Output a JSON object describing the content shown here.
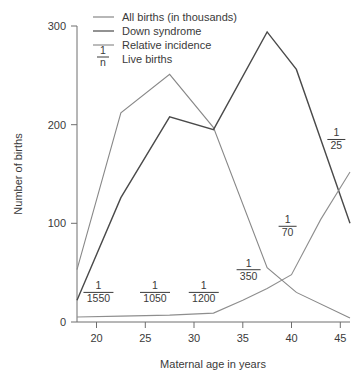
{
  "chart_data": {
    "type": "line",
    "title": "",
    "xlabel": "Maternal age in years",
    "ylabel": "Number of births",
    "xlim": [
      18,
      46
    ],
    "ylim": [
      0,
      300
    ],
    "xticks": [
      20,
      25,
      30,
      35,
      40,
      45
    ],
    "yticks": [
      0,
      100,
      200,
      300
    ],
    "grid": false,
    "legend_position": "top-center",
    "series": [
      {
        "name": "All births (in thousands)",
        "color": "#888888",
        "x": [
          18,
          22.5,
          27.5,
          32,
          37.5,
          40.5,
          46
        ],
        "values": [
          53,
          212,
          251,
          197,
          55,
          30,
          4
        ]
      },
      {
        "name": "Down syndrome",
        "color": "#4a4a4a",
        "x": [
          18,
          22.5,
          27.5,
          32,
          37.5,
          40.5,
          46
        ],
        "values": [
          22,
          126,
          208,
          195,
          294,
          256,
          100
        ]
      },
      {
        "name": "Relative incidence",
        "color": "#8e8e8e",
        "x": [
          18,
          22.5,
          27.5,
          32,
          35,
          37.5,
          40,
          43,
          46
        ],
        "values": [
          5,
          6,
          7,
          9,
          22,
          34,
          48,
          104,
          152
        ]
      }
    ],
    "annotations": [
      {
        "label": "Live births",
        "numerator": "1",
        "denominator": "n"
      },
      {
        "numerator": "1",
        "denominator": "1550",
        "x": 20.2,
        "y": 30
      },
      {
        "numerator": "1",
        "denominator": "1050",
        "x": 26.0,
        "y": 30
      },
      {
        "numerator": "1",
        "denominator": "1200",
        "x": 31.0,
        "y": 30
      },
      {
        "numerator": "1",
        "denominator": "350",
        "x": 35.6,
        "y": 53
      },
      {
        "numerator": "1",
        "denominator": "70",
        "x": 39.6,
        "y": 97
      },
      {
        "numerator": "1",
        "denominator": "25",
        "x": 44.6,
        "y": 185
      }
    ]
  },
  "legend": {
    "items": [
      {
        "label": "All births (in thousands)",
        "marker": "line",
        "color": "#888888"
      },
      {
        "label": "Down syndrome",
        "marker": "line",
        "color": "#4a4a4a"
      },
      {
        "label": "Relative incidence",
        "marker": "line",
        "color": "#8e8e8e"
      },
      {
        "label": "Live births",
        "marker": "fraction",
        "numerator": "1",
        "denominator": "n"
      }
    ]
  },
  "axes": {
    "y_title": "Number of births",
    "x_title": "Maternal age in years",
    "y_tick_labels": [
      "300",
      "200",
      "100",
      "0"
    ],
    "x_tick_labels": [
      "20",
      "25",
      "30",
      "35",
      "40",
      "45"
    ]
  }
}
